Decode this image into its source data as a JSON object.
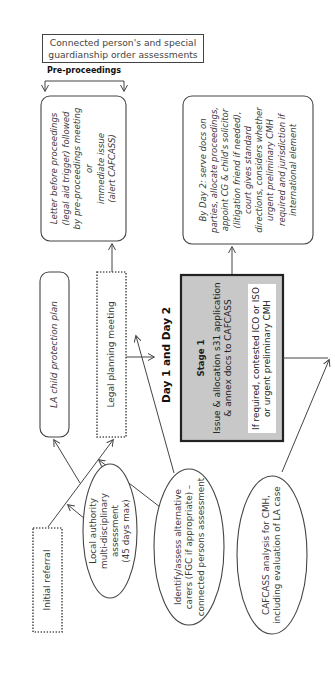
{
  "diagram": {
    "top_note": "Connected person's and special guardianship order assessments",
    "pre_proceedings_label": "Pre-proceedings",
    "day_label": "Day 1 and Day 2",
    "nodes": {
      "letter_before_proceedings": {
        "lines": [
          "Letter before proceedings",
          "(legal aid trigger) followed",
          "by pre-proceedings meeting",
          "or",
          "immediate issue",
          "(alert CAFCASS)"
        ],
        "style": "rounded-italic"
      },
      "by_day_2": {
        "lines": [
          "By Day 2: serve docs on",
          "parties, allocate proceedings,",
          "appoint CG & child's solicitor",
          "(litigation friend if needed),",
          "court gives standard",
          "directions, considers whether",
          "urgent preliminary CMH",
          "required and jurisdiction if",
          "international element"
        ],
        "style": "rounded-italic"
      },
      "la_child_protection_plan": {
        "text": "LA child protection plan",
        "style": "rounded-italic"
      },
      "legal_planning_meeting": {
        "text": "Legal planning meeting",
        "style": "dotted"
      },
      "stage_1": {
        "title": "Stage 1",
        "line1": "Issue & allocation s31 application",
        "line2": "& annex docs to CAFCASS",
        "inner_line1": "If required, contested ICO or ISO",
        "inner_line2": "or urgent preliminary CMH",
        "style": "gray-thick"
      },
      "initial_referral": {
        "text": "Initial referral",
        "style": "dotted"
      },
      "local_authority_assessment": {
        "lines": [
          "Local authority",
          "multi-disciplinary",
          "assessment",
          "(45 days max)"
        ],
        "style": "ellipse"
      },
      "identify_assess_carers": {
        "lines": [
          "Identify/assess alternative",
          "carers (FGC if appropriate) –",
          "connected persons assessment"
        ],
        "style": "ellipse"
      },
      "cafcass_analysis": {
        "lines": [
          "CAFCASS analysis for CMH,",
          "including evaluation of LA case"
        ],
        "style": "ellipse"
      }
    },
    "colors": {
      "stroke": "#444444",
      "stage_fill": "#c8c8c8",
      "stage_border": "#222222",
      "text": "#3a3a3a"
    }
  }
}
